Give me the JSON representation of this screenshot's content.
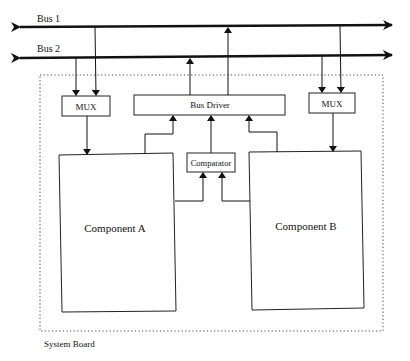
{
  "diagram": {
    "type": "block-diagram",
    "buses": [
      {
        "id": "bus1",
        "label": "Bus 1"
      },
      {
        "id": "bus2",
        "label": "Bus 2"
      }
    ],
    "container": {
      "label": "System Board",
      "style": "dotted"
    },
    "blocks": [
      {
        "id": "mux_left",
        "label": "MUX"
      },
      {
        "id": "bus_driver",
        "label": "Bus Driver"
      },
      {
        "id": "mux_right",
        "label": "MUX"
      },
      {
        "id": "comparator",
        "label": "Comparator"
      },
      {
        "id": "component_a",
        "label": "Component A"
      },
      {
        "id": "component_b",
        "label": "Component B"
      }
    ],
    "connections": [
      {
        "from": "bus2",
        "to": "mux_left"
      },
      {
        "from": "bus1",
        "to": "mux_left"
      },
      {
        "from": "mux_left",
        "to": "component_a"
      },
      {
        "from": "component_a",
        "to": "bus_driver"
      },
      {
        "from": "comparator",
        "to": "bus_driver"
      },
      {
        "from": "component_b",
        "to": "bus_driver"
      },
      {
        "from": "bus_driver",
        "to": "bus2"
      },
      {
        "from": "bus_driver",
        "to": "bus1"
      },
      {
        "from": "component_a",
        "to": "comparator"
      },
      {
        "from": "component_b",
        "to": "comparator"
      },
      {
        "from": "bus2",
        "to": "mux_right"
      },
      {
        "from": "bus1",
        "to": "mux_right"
      },
      {
        "from": "mux_right",
        "to": "component_b"
      }
    ]
  },
  "colors": {
    "line": "#111111",
    "background": "#ffffff"
  }
}
